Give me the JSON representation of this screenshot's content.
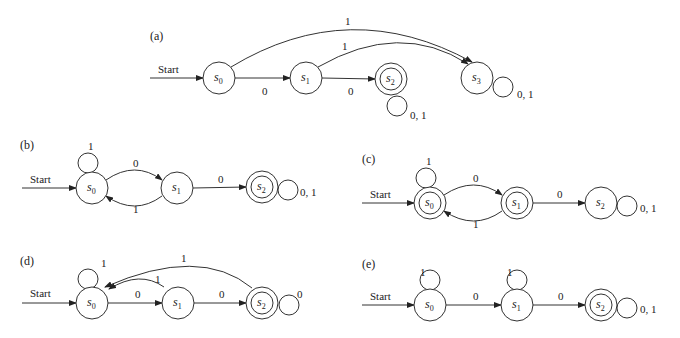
{
  "figure": {
    "start_label": "Start",
    "panels": [
      {
        "id": "a",
        "label": "(a)",
        "label_pos": [
          150,
          40
        ],
        "states": [
          {
            "name": "s0",
            "sub": "0",
            "cx": 219,
            "cy": 78,
            "accepting": false
          },
          {
            "name": "s1",
            "sub": "1",
            "cx": 306,
            "cy": 78,
            "accepting": false
          },
          {
            "name": "s2",
            "sub": "2",
            "cx": 391,
            "cy": 79,
            "accepting": true
          },
          {
            "name": "s3",
            "sub": "3",
            "cx": 477,
            "cy": 78,
            "accepting": false
          }
        ],
        "start": {
          "x1": 150,
          "y": 78,
          "text_x": 158,
          "text_y": 73
        },
        "edges": [
          {
            "type": "line",
            "from": 0,
            "to": 1,
            "label": "0",
            "lx": 262,
            "ly": 95
          },
          {
            "type": "line",
            "from": 1,
            "to": 2,
            "label": "0",
            "lx": 348,
            "ly": 95
          },
          {
            "type": "curve",
            "path": "M 231 67 Q 350 -5 472 62",
            "label": "1",
            "lx": 345,
            "ly": 25
          },
          {
            "type": "curve",
            "path": "M 318 67 Q 400 20 468 64",
            "label": "1",
            "lx": 342,
            "ly": 50
          },
          {
            "type": "loop",
            "cx": 397,
            "cy": 106,
            "label": "0, 1",
            "lx": 410,
            "ly": 119
          },
          {
            "type": "loop",
            "cx": 503,
            "cy": 87,
            "label": "0, 1",
            "lx": 517,
            "ly": 98
          }
        ]
      },
      {
        "id": "b",
        "label": "(b)",
        "label_pos": [
          20,
          149
        ],
        "states": [
          {
            "name": "s0",
            "sub": "0",
            "cx": 92,
            "cy": 188,
            "accepting": false
          },
          {
            "name": "s1",
            "sub": "1",
            "cx": 177,
            "cy": 188,
            "accepting": false
          },
          {
            "name": "s2",
            "sub": "2",
            "cx": 262,
            "cy": 187,
            "accepting": true
          }
        ],
        "start": {
          "x1": 22,
          "y": 188,
          "text_x": 30,
          "text_y": 183
        },
        "edges": [
          {
            "type": "curve",
            "path": "M 106 180 Q 135 160 162 180",
            "label": "0",
            "lx": 133,
            "ly": 167
          },
          {
            "type": "curve",
            "path": "M 162 196 Q 135 216 106 196",
            "label": "1",
            "lx": 133,
            "ly": 213
          },
          {
            "type": "line",
            "from": 1,
            "to": 2,
            "label": "0",
            "lx": 218,
            "ly": 183
          },
          {
            "type": "loop",
            "cx": 88,
            "cy": 163,
            "label": "1",
            "lx": 88,
            "ly": 150
          },
          {
            "type": "loop",
            "cx": 288,
            "cy": 190,
            "label": "0, 1",
            "lx": 300,
            "ly": 196
          }
        ]
      },
      {
        "id": "c",
        "label": "(c)",
        "label_pos": [
          362,
          163
        ],
        "states": [
          {
            "name": "s0",
            "sub": "0",
            "cx": 430,
            "cy": 203,
            "accepting": true
          },
          {
            "name": "s1",
            "sub": "1",
            "cx": 517,
            "cy": 203,
            "accepting": true
          },
          {
            "name": "s2",
            "sub": "2",
            "cx": 601,
            "cy": 203,
            "accepting": false
          }
        ],
        "start": {
          "x1": 362,
          "y": 203,
          "text_x": 370,
          "text_y": 198
        },
        "edges": [
          {
            "type": "curve",
            "path": "M 444 195 Q 474 175 502 195",
            "label": "0",
            "lx": 473,
            "ly": 182
          },
          {
            "type": "curve",
            "path": "M 502 211 Q 474 231 444 211",
            "label": "1",
            "lx": 473,
            "ly": 228
          },
          {
            "type": "line",
            "from": 1,
            "to": 2,
            "label": "0",
            "lx": 557,
            "ly": 198
          },
          {
            "type": "loop",
            "cx": 426,
            "cy": 178,
            "label": "1",
            "lx": 426,
            "ly": 165
          },
          {
            "type": "loop",
            "cx": 627,
            "cy": 206,
            "label": "0, 1",
            "lx": 640,
            "ly": 212
          }
        ]
      },
      {
        "id": "d",
        "label": "(d)",
        "label_pos": [
          20,
          265
        ],
        "states": [
          {
            "name": "s0",
            "sub": "0",
            "cx": 92,
            "cy": 303,
            "accepting": false
          },
          {
            "name": "s1",
            "sub": "1",
            "cx": 178,
            "cy": 303,
            "accepting": false
          },
          {
            "name": "s2",
            "sub": "2",
            "cx": 262,
            "cy": 303,
            "accepting": true
          }
        ],
        "start": {
          "x1": 22,
          "y": 303,
          "text_x": 30,
          "text_y": 297
        },
        "edges": [
          {
            "type": "line",
            "from": 0,
            "to": 1,
            "label": "0",
            "lx": 135,
            "ly": 298
          },
          {
            "type": "line",
            "from": 1,
            "to": 2,
            "label": "0",
            "lx": 219,
            "ly": 298
          },
          {
            "type": "curve",
            "path": "M 164 287 Q 140 270 109 289",
            "label": "1",
            "lx": 155,
            "ly": 283
          },
          {
            "type": "curve",
            "path": "M 252 288 Q 200 245 105 287",
            "label": "1",
            "lx": 181,
            "ly": 262
          },
          {
            "type": "loop",
            "cx": 88,
            "cy": 279,
            "label": "1",
            "lx": 101,
            "ly": 267
          },
          {
            "type": "loop",
            "cx": 289,
            "cy": 305,
            "label": "0",
            "lx": 297,
            "ly": 298
          }
        ]
      },
      {
        "id": "e",
        "label": "(e)",
        "label_pos": [
          362,
          268
        ],
        "states": [
          {
            "name": "s0",
            "sub": "0",
            "cx": 430,
            "cy": 305,
            "accepting": false
          },
          {
            "name": "s1",
            "sub": "1",
            "cx": 517,
            "cy": 305,
            "accepting": false
          },
          {
            "name": "s2",
            "sub": "2",
            "cx": 601,
            "cy": 305,
            "accepting": true
          }
        ],
        "start": {
          "x1": 362,
          "y": 305,
          "text_x": 370,
          "text_y": 300
        },
        "edges": [
          {
            "type": "line",
            "from": 0,
            "to": 1,
            "label": "0",
            "lx": 473,
            "ly": 300
          },
          {
            "type": "line",
            "from": 1,
            "to": 2,
            "label": "0",
            "lx": 558,
            "ly": 300
          },
          {
            "type": "loop",
            "cx": 430,
            "cy": 280,
            "label": "1",
            "lx": 420,
            "ly": 276
          },
          {
            "type": "loop",
            "cx": 517,
            "cy": 280,
            "label": "1",
            "lx": 507,
            "ly": 276
          },
          {
            "type": "loop",
            "cx": 627,
            "cy": 308,
            "label": "0, 1",
            "lx": 640,
            "ly": 313
          }
        ]
      }
    ]
  }
}
